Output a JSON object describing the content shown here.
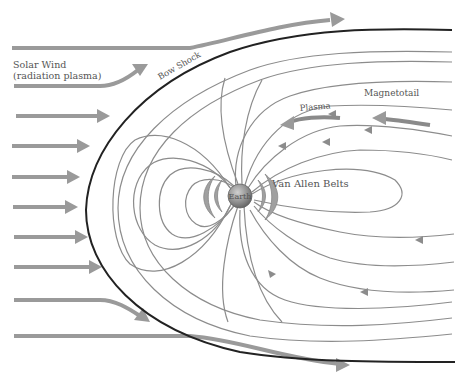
{
  "diagram": {
    "labels": {
      "solar_wind_line1": "Solar Wind",
      "solar_wind_line2": "(radiation plasma)",
      "bow_shock": "Bow Shock",
      "magnetotail": "Magnetotail",
      "plasma": "Plasma",
      "van_allen_belts": "Van Allen Belts",
      "earth": "Earth"
    },
    "colors": {
      "background": "#ffffff",
      "bow_shock": "#222222",
      "solar_wind_arrows": "#9a9a9a",
      "field_lines": "#8c8c8c",
      "earth": "#8f8f8f",
      "van_allen_belts": "#a0a0a0",
      "text": "#555555"
    },
    "solar_wind_arrow_count": 9
  }
}
